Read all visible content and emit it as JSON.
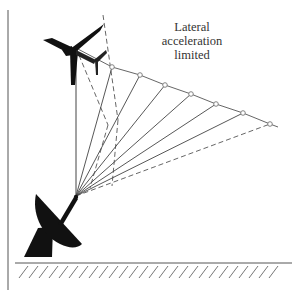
{
  "caption": {
    "lines": [
      "Lateral",
      "acceleration",
      "limited"
    ]
  },
  "colors": {
    "ink": "#222222",
    "line": "#555555",
    "marker": "#777777",
    "background": "#ffffff"
  },
  "geometry": {
    "radar_apex": [
      76,
      196
    ],
    "aircraft_position": [
      76,
      48
    ],
    "trajectory_points": [
      [
        112,
        67
      ],
      [
        140,
        75
      ],
      [
        165,
        85
      ],
      [
        191,
        94
      ],
      [
        216,
        104
      ],
      [
        243,
        113
      ],
      [
        270,
        124
      ]
    ],
    "trajectory_end": [
      278,
      127
    ],
    "ground_y": 263,
    "ground_x": [
      15,
      292
    ]
  },
  "elements": {
    "lead_aircraft": "aircraft-icon",
    "second_aircraft": "aircraft-icon",
    "radar": "radar-dish-icon",
    "ground": "ground-hatch"
  }
}
